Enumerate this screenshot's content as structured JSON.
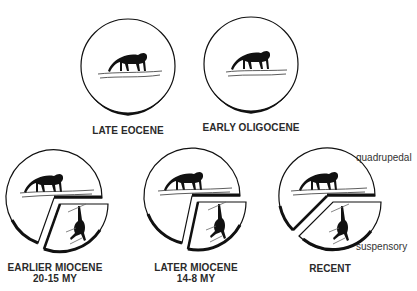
{
  "figure": {
    "panels": [
      {
        "id": "late-eocene",
        "label": "LATE EOCENE",
        "sublabel": "",
        "locomotion": [
          "quadrupedal"
        ]
      },
      {
        "id": "early-oligocene",
        "label": "EARLY OLIGOCENE",
        "sublabel": "",
        "locomotion": [
          "quadrupedal"
        ]
      },
      {
        "id": "earlier-miocene",
        "label": "EARLIER MIOCENE",
        "sublabel": "20-15 MY",
        "locomotion": [
          "quadrupedal",
          "suspensory"
        ]
      },
      {
        "id": "later-miocene",
        "label": "LATER MIOCENE",
        "sublabel": "14-8 MY",
        "locomotion": [
          "quadrupedal",
          "suspensory"
        ]
      },
      {
        "id": "recent",
        "label": "RECENT",
        "sublabel": "",
        "locomotion": [
          "quadrupedal",
          "suspensory"
        ]
      }
    ],
    "legend": {
      "quadrupedal": "quadrupedal",
      "suspensory": "suspensory"
    },
    "icons": {
      "quadruped": "monkey-walking-on-branch-icon",
      "suspensory": "ape-hanging-from-branch-icon"
    },
    "colors": {
      "stroke": "#111111",
      "background": "#ffffff",
      "text": "#2a2a2a"
    }
  }
}
